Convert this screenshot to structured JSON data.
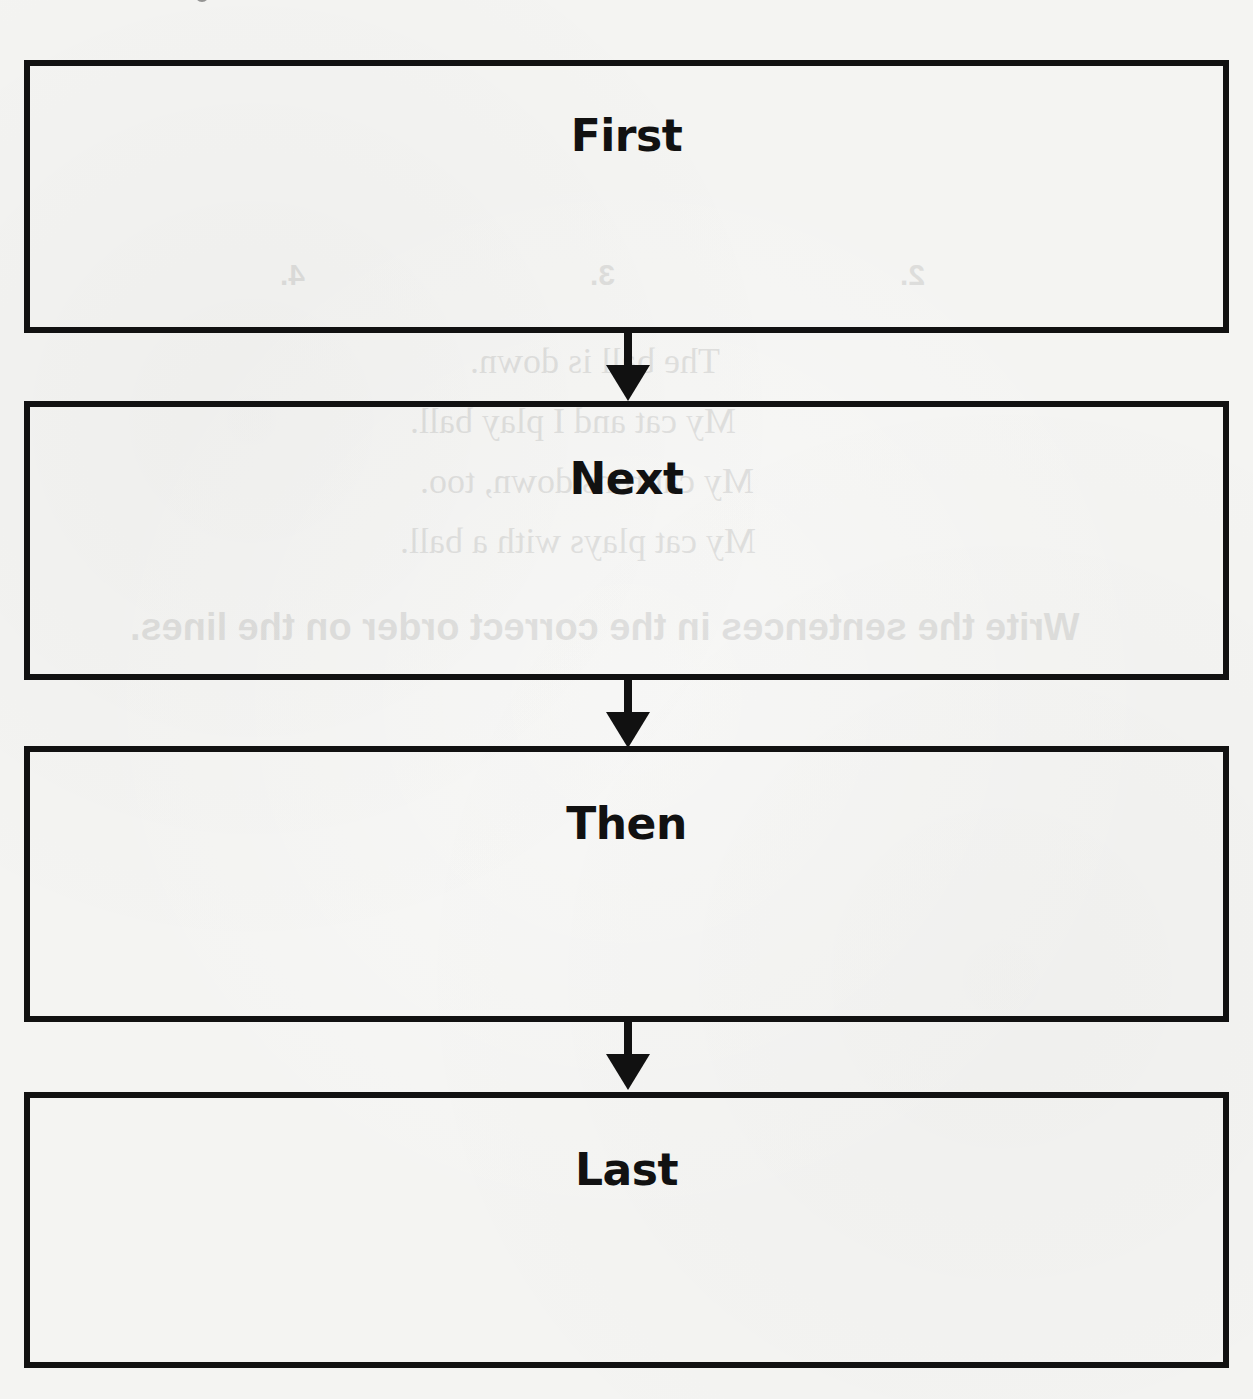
{
  "diagram": {
    "type": "sequence-flowchart",
    "stages": [
      {
        "label": "First"
      },
      {
        "label": "Next"
      },
      {
        "label": "Then"
      },
      {
        "label": "Last"
      }
    ],
    "arrows": [
      {
        "from": "First",
        "to": "Next"
      },
      {
        "from": "Next",
        "to": "Then"
      },
      {
        "from": "Then",
        "to": "Last"
      }
    ]
  },
  "bleed_through": {
    "lines": [
      "The ball is down.",
      "My cat and I play ball.",
      "My cat runs down, too.",
      "My cat plays with a ball."
    ],
    "instruction": "Write the sentences in the correct order on the lines.",
    "panel_numbers": [
      "1.",
      "2.",
      "3.",
      "4."
    ]
  },
  "colors": {
    "ink": "#111111",
    "paper": "#f4f4f2"
  }
}
